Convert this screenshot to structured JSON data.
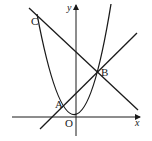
{
  "diagram": {
    "type": "coordinate-geometry",
    "axes": {
      "x_label": "x",
      "y_label": "y",
      "origin_label": "O"
    },
    "curves": [
      {
        "name": "parabola",
        "kind": "parabola",
        "vertex_px": [
          76,
          117
        ]
      },
      {
        "name": "line-CB",
        "kind": "line",
        "from_px": [
          29,
          8
        ],
        "to_px": [
          138,
          110
        ]
      },
      {
        "name": "line-AB",
        "kind": "line",
        "from_px": [
          40,
          129
        ],
        "to_px": [
          137,
          33
        ]
      }
    ],
    "points": [
      {
        "label": "A"
      },
      {
        "label": "B"
      },
      {
        "label": "C"
      }
    ],
    "colors": {
      "stroke": "#1a1a1a",
      "background": "#ffffff"
    }
  }
}
